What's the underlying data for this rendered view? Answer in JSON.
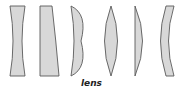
{
  "figure": {
    "caption": "lens",
    "colors": {
      "fill": "#d8d8d8",
      "stroke": "#5a5a5a",
      "background": "#ffffff",
      "caption": "#222222"
    },
    "lenses": [
      {
        "type": "biconcave"
      },
      {
        "type": "plano-concave"
      },
      {
        "type": "positive-meniscus"
      },
      {
        "type": "biconvex"
      },
      {
        "type": "plano-convex"
      },
      {
        "type": "negative-meniscus"
      }
    ]
  }
}
